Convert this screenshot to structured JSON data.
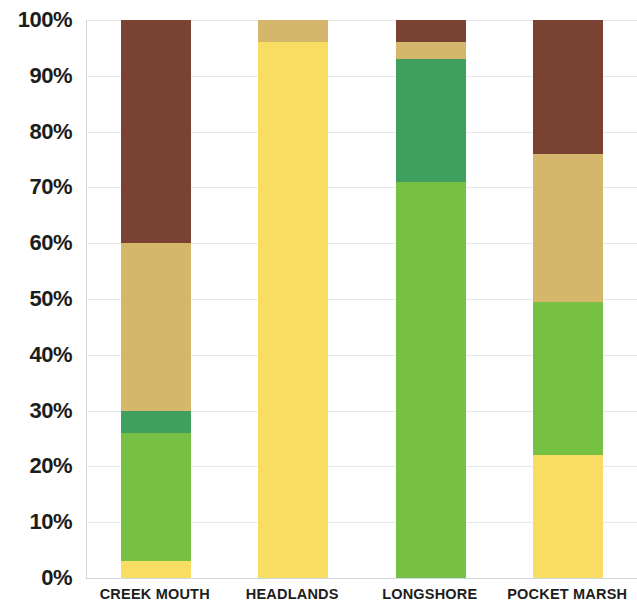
{
  "chart_data": {
    "type": "bar",
    "stacked": true,
    "normalized": true,
    "title": "",
    "subtitle": "",
    "xlabel": "",
    "ylabel": "",
    "ylim": [
      0,
      100
    ],
    "grid": true,
    "legend": "none",
    "tick_suffix": "%",
    "categories": [
      "CREEK MOUTH",
      "HEADLANDS",
      "LONGSHORE",
      "POCKET MARSH"
    ],
    "ytick_labels": [
      "0%",
      "10%",
      "20%",
      "30%",
      "40%",
      "50%",
      "60%",
      "70%",
      "80%",
      "90%",
      "100%"
    ],
    "ytick_values": [
      0,
      10,
      20,
      30,
      40,
      50,
      60,
      70,
      80,
      90,
      100
    ],
    "series": [
      {
        "name": "yellow",
        "color": "#f9dc62",
        "values": [
          3,
          96,
          0,
          22
        ]
      },
      {
        "name": "light-green",
        "color": "#76c043",
        "values": [
          23,
          0,
          71,
          27.5
        ]
      },
      {
        "name": "dark-green",
        "color": "#3f9f5c",
        "values": [
          4,
          0,
          22,
          0
        ]
      },
      {
        "name": "tan",
        "color": "#d4b76a",
        "values": [
          30,
          4,
          3,
          26.5
        ]
      },
      {
        "name": "brown",
        "color": "#7a4233",
        "values": [
          40,
          0,
          4,
          24
        ]
      }
    ]
  },
  "axis": {
    "y_axis_name": "percent-axis",
    "x_axis_name": "site-axis"
  },
  "colors": {
    "yellow": "#f9dc62",
    "light_green": "#76c043",
    "dark_green": "#3f9f5c",
    "tan": "#d4b76a",
    "brown": "#7a4233",
    "gridline": "#e3eaec",
    "axis_line": "#cfd8da",
    "text": "#1d1d1b",
    "background": "#ffffff"
  }
}
